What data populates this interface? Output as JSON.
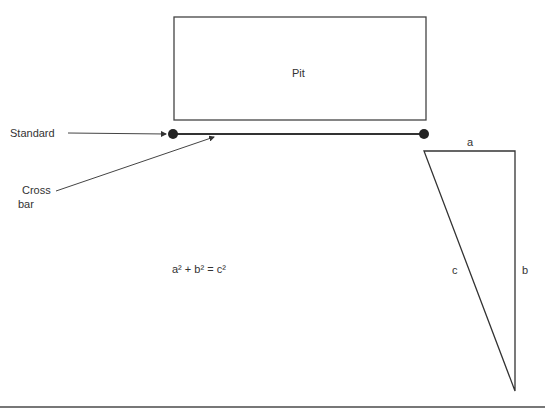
{
  "diagram": {
    "pit": {
      "label": "Pit"
    },
    "labels": {
      "standard": "Standard",
      "crossbar_line1": "Cross",
      "crossbar_line2": "bar",
      "equation": "a² + b² = c²",
      "side_a": "a",
      "side_b": "b",
      "side_c": "c"
    },
    "colors": {
      "stroke": "#333333",
      "background": "#ffffff"
    }
  }
}
